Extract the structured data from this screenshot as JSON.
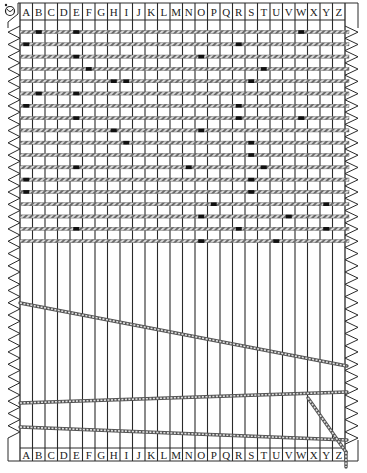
{
  "columns": [
    "A",
    "B",
    "C",
    "D",
    "E",
    "F",
    "G",
    "H",
    "I",
    "J",
    "K",
    "L",
    "M",
    "N",
    "O",
    "P",
    "Q",
    "R",
    "S",
    "T",
    "U",
    "V",
    "W",
    "X",
    "Y",
    "Z"
  ],
  "corner_icon": "knot-icon",
  "colors": {
    "line": "#2a2a2a",
    "rope": "#555555",
    "rope_highlight": "#dddddd",
    "mark": "#111111",
    "paper": "#ffffff"
  },
  "horizontal_ropes": [
    {
      "marks": [
        "B",
        "E",
        "W"
      ]
    },
    {
      "marks": [
        "A",
        "R"
      ]
    },
    {
      "marks": [
        "E",
        "O"
      ]
    },
    {
      "marks": [
        "F",
        "T"
      ]
    },
    {
      "marks": [
        "H",
        "I",
        "S"
      ]
    },
    {
      "marks": [
        "B",
        "E"
      ]
    },
    {
      "marks": [
        "A",
        "R"
      ]
    },
    {
      "marks": [
        "E",
        "R",
        "W"
      ]
    },
    {
      "marks": [
        "H",
        "O"
      ]
    },
    {
      "marks": [
        "I",
        "S"
      ]
    },
    {
      "marks": [
        "S"
      ]
    },
    {
      "marks": [
        "E",
        "N",
        "T"
      ]
    },
    {
      "marks": [
        "A",
        "S"
      ]
    },
    {
      "marks": [
        "A",
        "S"
      ]
    },
    {
      "marks": [
        "P",
        "Y"
      ]
    },
    {
      "marks": [
        "O",
        "V"
      ]
    },
    {
      "marks": [
        "E",
        "R",
        "Y"
      ]
    },
    {
      "marks": [
        "O",
        "U"
      ]
    }
  ],
  "loose_ropes": [
    {
      "name": "diagonal-rope-1",
      "from": "left",
      "to": "right",
      "description": "descending left to right"
    },
    {
      "name": "diagonal-rope-2",
      "from": "left",
      "to": "right",
      "description": "slightly ascending left to right"
    },
    {
      "name": "diagonal-rope-3",
      "from": "left",
      "to": "right",
      "description": "slightly descending left to right"
    },
    {
      "name": "hanging-rope",
      "from": "W column",
      "to": "below Z",
      "description": "dangling end"
    }
  ]
}
